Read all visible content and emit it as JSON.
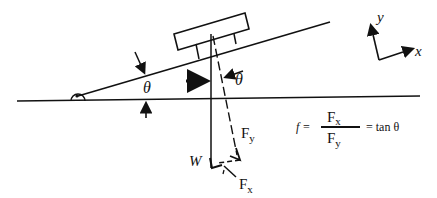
{
  "diagram": {
    "labels": {
      "incline_angle": "θ",
      "weight_angle": "θ",
      "weight": "W",
      "normal_component": "F",
      "normal_component_sub": "y",
      "parallel_component": "F",
      "parallel_component_sub": "x"
    },
    "axes": {
      "y_label": "y",
      "x_label": "x"
    },
    "formula": {
      "lhs": "f =",
      "numerator": "F",
      "numerator_sub": "x",
      "denominator": "F",
      "denominator_sub": "y",
      "rhs": "= tan θ"
    },
    "colors": {
      "ink": "#111111",
      "background": "#ffffff"
    }
  }
}
